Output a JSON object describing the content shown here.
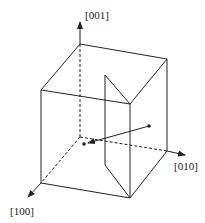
{
  "diagram": {
    "axes": [
      {
        "id": "z",
        "label": "[001]"
      },
      {
        "id": "y",
        "label": "[010]"
      },
      {
        "id": "x",
        "label": "[100]"
      }
    ],
    "colors": {
      "stroke": "#222222",
      "background": "#ffffff"
    }
  }
}
